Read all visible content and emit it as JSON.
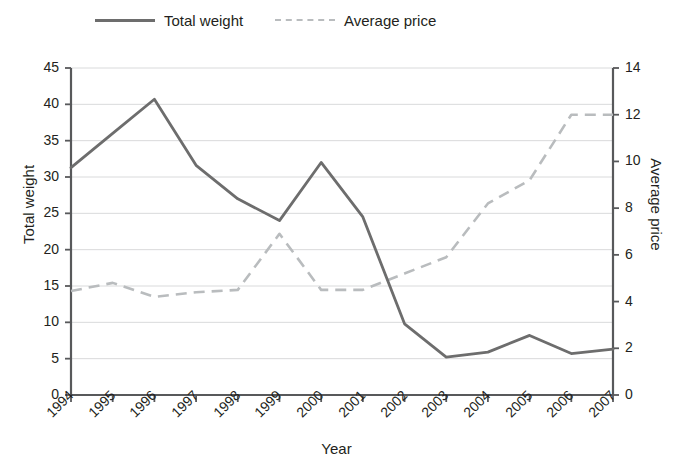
{
  "legend": {
    "position": "top-left",
    "entries": [
      {
        "label": "Total weight",
        "style": "solid",
        "color": "#6d6d6d"
      },
      {
        "label": "Average price",
        "style": "dashed",
        "color": "#b9bcbe"
      }
    ]
  },
  "axes": {
    "x_title": "Year",
    "y_left_title": "Total weight",
    "y_right_title": "Average price",
    "y_left_ticks": [
      "0",
      "5",
      "10",
      "15",
      "20",
      "25",
      "30",
      "35",
      "40",
      "45"
    ],
    "y_right_ticks": [
      "0",
      "2",
      "4",
      "6",
      "8",
      "10",
      "12",
      "14"
    ],
    "x_ticks": [
      "1994",
      "1995",
      "1996",
      "1997",
      "1998",
      "1999",
      "2000",
      "2001",
      "2002",
      "2003",
      "2004",
      "2005",
      "2006",
      "2007"
    ]
  },
  "chart_data": {
    "type": "line",
    "title": "",
    "subtitle": "",
    "xlabel": "Year",
    "ylabel": "Total weight",
    "y2label": "Average price",
    "grid": true,
    "legend_position": "top-left",
    "x": [
      "1994",
      "1995",
      "1996",
      "1997",
      "1998",
      "1999",
      "2000",
      "2001",
      "2002",
      "2003",
      "2004",
      "2005",
      "2006",
      "2007"
    ],
    "xlim": [
      0,
      13
    ],
    "ylim": [
      0,
      45
    ],
    "y2lim": [
      0,
      14
    ],
    "yticks": [
      0,
      5,
      10,
      15,
      20,
      25,
      30,
      35,
      40,
      45
    ],
    "y2ticks": [
      0,
      2,
      4,
      6,
      8,
      10,
      12,
      14
    ],
    "series": [
      {
        "name": "Total weight",
        "axis": "left",
        "style": "solid",
        "color": "#6d6d6d",
        "values": [
          31.3,
          36.0,
          40.7,
          31.6,
          27.0,
          24.0,
          32.0,
          24.5,
          9.8,
          5.2,
          5.9,
          8.2,
          5.7,
          6.3
        ]
      },
      {
        "name": "Average price",
        "axis": "right",
        "style": "dashed",
        "color": "#b9bcbe",
        "values": [
          4.45,
          4.8,
          4.2,
          4.4,
          4.5,
          6.9,
          4.5,
          4.5,
          5.2,
          5.9,
          8.2,
          9.2,
          12.0,
          12.0
        ]
      }
    ]
  }
}
